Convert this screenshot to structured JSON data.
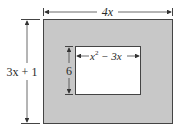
{
  "diagram": {
    "outer_width_label": "4x",
    "outer_height_label": "3x + 1",
    "inner_width_label_base": "x",
    "inner_width_label_exp": "2",
    "inner_width_label_rest": " − 3x",
    "inner_height_label": "6",
    "colors": {
      "shaded": "#c8c8c8",
      "inner": "#ffffff",
      "stroke": "#333333"
    }
  }
}
